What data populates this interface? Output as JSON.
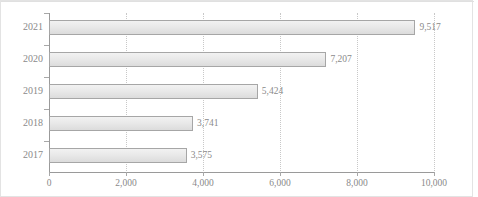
{
  "chart_data": {
    "type": "bar",
    "orientation": "horizontal",
    "title": "",
    "subtitle": "",
    "xlabel": "",
    "ylabel": "",
    "categories": [
      "2017",
      "2018",
      "2019",
      "2020",
      "2021"
    ],
    "values": [
      3575,
      3741,
      5424,
      7207,
      9517
    ],
    "value_labels": [
      "3,575",
      "3,741",
      "5,424",
      "7,207",
      "9,517"
    ],
    "series": [
      {
        "name": "",
        "values": [
          3575,
          3741,
          5424,
          7207,
          9517
        ]
      }
    ],
    "xlim": [
      0,
      10000
    ],
    "xticks": [
      0,
      2000,
      4000,
      6000,
      8000,
      10000
    ],
    "xtick_labels": [
      "0",
      "2,000",
      "4,000",
      "6,000",
      "8,000",
      "10,000"
    ],
    "grid": true,
    "grid_axis": "x",
    "grid_style": "dotted",
    "legend": false,
    "legend_position": "none",
    "colors": {
      "bar_fill": "#e9e9e9",
      "bar_border": "#a6a6a6",
      "text": "#8a8a8a",
      "gridline": "#c8c8c8",
      "axis": "#9a9a9a",
      "background": "#ffffff",
      "frame_border": "#e3e3e3"
    }
  }
}
